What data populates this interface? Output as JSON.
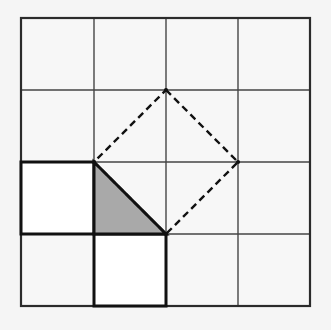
{
  "figure": {
    "canvas": {
      "width": 331,
      "height": 330,
      "background": "#f5f5f5"
    },
    "grid": {
      "label": "four-by-four-square-grid",
      "columns": 4,
      "rows": 4,
      "x_start": 21,
      "y_start": 18,
      "cell_size": 72,
      "x_lines": [
        21,
        94,
        166,
        238,
        310
      ],
      "y_lines": [
        18,
        90,
        162,
        234,
        306
      ],
      "line_color": "#454545",
      "line_width": 1.4,
      "outer_line_color": "#2b2b2b",
      "outer_line_width": 2.2,
      "cell_fill": "#f7f7f7"
    },
    "tilted_square": {
      "label": "dashed-tilted-square",
      "stroke": "#111111",
      "stroke_width": 2.4,
      "dash_pattern": "7,4.5",
      "fill": "none",
      "vertices": [
        {
          "name": "top",
          "x": 166,
          "y": 90
        },
        {
          "name": "right",
          "x": 238,
          "y": 162
        },
        {
          "name": "bottom",
          "x": 166,
          "y": 234
        },
        {
          "name": "left",
          "x": 94,
          "y": 162
        }
      ],
      "side_length_cells": 1.4142,
      "area_cells": 2
    },
    "shaded_triangle": {
      "label": "shaded-right-triangle",
      "fill": "#a9a9a9",
      "stroke": "#111111",
      "stroke_width": 3,
      "vertices": [
        {
          "name": "top-left",
          "x": 94,
          "y": 162
        },
        {
          "name": "bottom-right",
          "x": 166,
          "y": 234
        },
        {
          "name": "bottom-left",
          "x": 94,
          "y": 234
        }
      ],
      "legs_cells": 1,
      "area_cells": 0.5
    },
    "white_squares": [
      {
        "label": "white-square-left",
        "fill": "#ffffff",
        "stroke": "#111111",
        "stroke_width": 3,
        "x": 21,
        "y": 162,
        "width": 73,
        "height": 72,
        "area_cells": 1
      },
      {
        "label": "white-square-bottom",
        "fill": "#ffffff",
        "stroke": "#111111",
        "stroke_width": 3,
        "x": 94,
        "y": 234,
        "width": 72,
        "height": 72,
        "area_cells": 1
      }
    ]
  }
}
